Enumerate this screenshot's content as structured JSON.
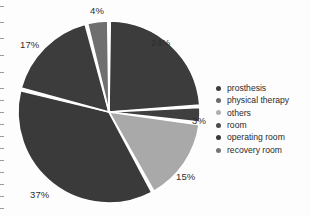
{
  "chart_data": {
    "type": "pie",
    "title": "",
    "subtitle": "",
    "xlabel": "",
    "ylabel": "",
    "legend_position": "right",
    "grid": false,
    "value_unit": "%",
    "categories": [
      "prosthesis",
      "physical therapy",
      "others",
      "room",
      "operating room",
      "recovery room"
    ],
    "values": [
      24,
      15,
      4,
      3,
      37,
      17
    ],
    "labels": [
      "24%",
      "15%",
      "4%",
      "3%",
      "37%",
      "17%"
    ],
    "colors": [
      "#3c3c3c",
      "#a9a9a9",
      "#6f6f6f",
      "#3f3f3f",
      "#3a3a3a",
      "#3c3c3c"
    ],
    "slices": [
      {
        "name": "prosthesis",
        "value": 24,
        "label": "24%",
        "color": "#3c3c3c",
        "start_deg": 0,
        "end_deg": 86.4
      },
      {
        "name": "room",
        "value": 3,
        "label": "3%",
        "color": "#3f3f3f",
        "start_deg": 86.4,
        "end_deg": 97.2
      },
      {
        "name": "physical therapy",
        "value": 15,
        "label": "15%",
        "color": "#a9a9a9",
        "start_deg": 97.2,
        "end_deg": 151.2
      },
      {
        "name": "operating room",
        "value": 37,
        "label": "37%",
        "color": "#3a3a3a",
        "start_deg": 151.2,
        "end_deg": 284.4
      },
      {
        "name": "recovery room",
        "value": 17,
        "label": "17%",
        "color": "#3c3c3c",
        "start_deg": 284.4,
        "end_deg": 345.6
      },
      {
        "name": "others",
        "value": 4,
        "label": "4%",
        "color": "#6f6f6f",
        "start_deg": 345.6,
        "end_deg": 360
      }
    ]
  },
  "legend": {
    "items": [
      {
        "label": "prosthesis",
        "color": "#3c3c3c"
      },
      {
        "label": "physical therapy",
        "color": "#6a6a6a"
      },
      {
        "label": "others",
        "color": "#b0b0b0"
      },
      {
        "label": "room",
        "color": "#4a4a4a"
      },
      {
        "label": "operating room",
        "color": "#3a3a3a"
      },
      {
        "label": "recovery room",
        "color": "#757575"
      }
    ]
  },
  "pct_labels": [
    {
      "text": "24%",
      "x": 151,
      "y": 38
    },
    {
      "text": "4%",
      "x": 90,
      "y": 6
    },
    {
      "text": "17%",
      "x": 20,
      "y": 40
    },
    {
      "text": "37%",
      "x": 30,
      "y": 190
    },
    {
      "text": "15%",
      "x": 176,
      "y": 172
    },
    {
      "text": "3%",
      "x": 192,
      "y": 116
    }
  ],
  "geometry": {
    "cx": 109,
    "cy": 112,
    "r": 91,
    "gap_deg": 1.6,
    "separator_color": "#ffffff"
  }
}
